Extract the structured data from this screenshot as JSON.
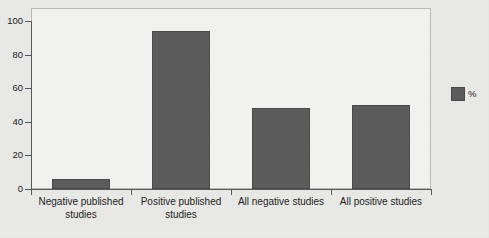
{
  "chart_data": {
    "type": "bar",
    "title": "",
    "xlabel": "",
    "ylabel": "",
    "ylim": [
      0,
      100
    ],
    "yticks": [
      0,
      20,
      40,
      60,
      80,
      100
    ],
    "grid": false,
    "legend_position": "right",
    "bar_color": "#5c5c5c",
    "categories": [
      "Negative published studies",
      "Positive published studies",
      "All negative studies",
      "All positive studies"
    ],
    "series": [
      {
        "name": "%",
        "values": [
          6,
          94,
          48,
          50
        ]
      }
    ]
  },
  "axis": {
    "y_tick_labels": [
      "100",
      "80",
      "60",
      "40",
      "20",
      "0"
    ]
  },
  "legend": {
    "entries": [
      {
        "label": "%",
        "color": "#5c5c5c"
      }
    ]
  },
  "caption": {
    "text": ""
  }
}
